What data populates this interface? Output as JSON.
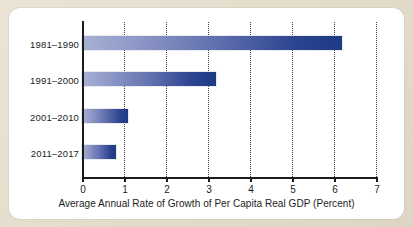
{
  "chart_data": {
    "type": "bar",
    "orientation": "horizontal",
    "title": "",
    "subtitle": "",
    "categories": [
      "1981–1990",
      "1991–2000",
      "2001–2010",
      "2011–2017"
    ],
    "values": [
      6.2,
      3.2,
      1.1,
      0.8
    ],
    "xlabel": "Average Annual Rate of Growth of Per Capita Real GDP (Percent)",
    "ylabel": "",
    "xlim": [
      0,
      7
    ],
    "xticks": [
      "0",
      "1",
      "2",
      "3",
      "4",
      "5",
      "6",
      "7"
    ],
    "grid": "vertical-dotted",
    "legend": "none",
    "series": [
      {
        "name": "Average Annual Rate of Growth of Per Capita Real GDP",
        "values": [
          6.2,
          3.2,
          1.1,
          0.8
        ]
      }
    ],
    "colors": {
      "bar_gradient_start": "#a8b0d4",
      "bar_gradient_end": "#1e3a84",
      "axis": "#1a1a1a",
      "gridline": "#3a3a3a",
      "panel_background": "#ffffff",
      "page_background": "#e8e0d0",
      "text": "#1c1c1c"
    }
  }
}
